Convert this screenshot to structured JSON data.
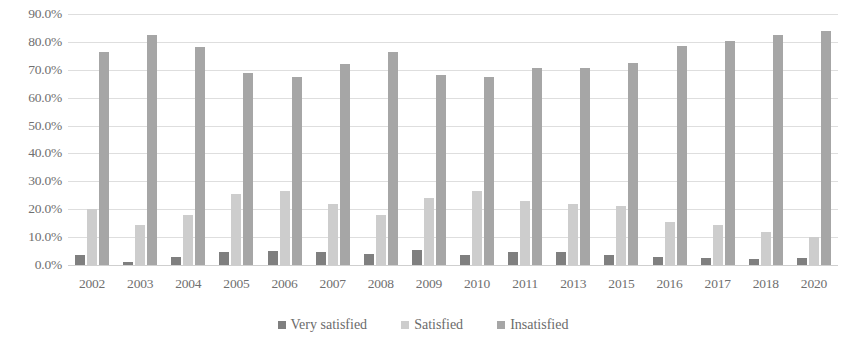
{
  "chart_data": {
    "type": "bar",
    "title": "",
    "xlabel": "",
    "ylabel": "",
    "ylim": [
      0,
      90
    ],
    "grid": true,
    "legend_position": "bottom",
    "y_ticks": [
      "0.0%",
      "10.0%",
      "20.0%",
      "30.0%",
      "40.0%",
      "50.0%",
      "60.0%",
      "70.0%",
      "80.0%",
      "90.0%"
    ],
    "y_tick_values": [
      0,
      10,
      20,
      30,
      40,
      50,
      60,
      70,
      80,
      90
    ],
    "categories": [
      "2002",
      "2003",
      "2004",
      "2005",
      "2006",
      "2007",
      "2008",
      "2009",
      "2010",
      "2011",
      "2013",
      "2015",
      "2016",
      "2017",
      "2018",
      "2020"
    ],
    "series": [
      {
        "name": "Very satisfied",
        "color": "#7f7f7f",
        "values": [
          3.5,
          1.0,
          3.0,
          4.5,
          5.0,
          4.5,
          4.0,
          5.5,
          3.5,
          4.5,
          4.5,
          3.5,
          3.0,
          2.5,
          2.0,
          2.5
        ]
      },
      {
        "name": "Satisfied",
        "color": "#cdcdcd",
        "values": [
          20.0,
          14.5,
          18.0,
          25.5,
          26.5,
          22.0,
          18.0,
          24.0,
          26.5,
          23.0,
          22.0,
          21.0,
          15.5,
          14.5,
          12.0,
          10.0
        ]
      },
      {
        "name": "Insatisfied",
        "color": "#a6a6a6",
        "values": [
          76.5,
          82.5,
          78.0,
          69.0,
          67.5,
          72.0,
          76.5,
          68.0,
          67.5,
          70.5,
          70.5,
          72.5,
          78.5,
          80.5,
          82.5,
          84.0
        ]
      }
    ]
  }
}
